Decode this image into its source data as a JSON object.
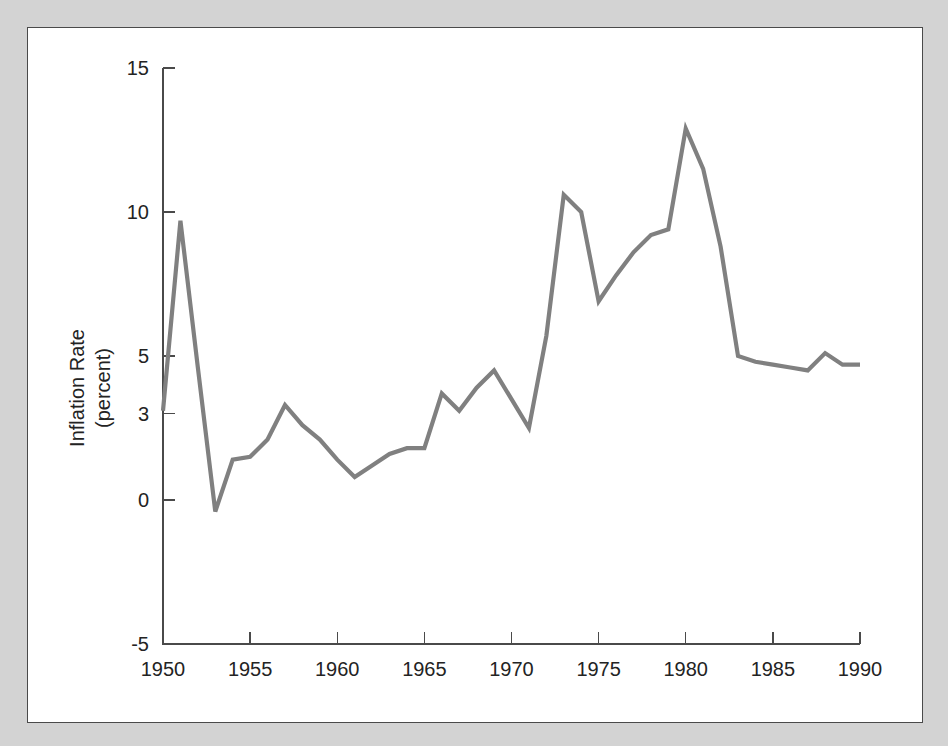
{
  "figure": {
    "background_color": "#d3d3d3",
    "panel_color": "#ffffff",
    "border_color": "#4a4a4a",
    "line_color": "#808080",
    "text_color": "#232323"
  },
  "axis": {
    "y_title_line1": "Inflation Rate",
    "y_title_line2": "(percent)",
    "x_title": ""
  },
  "chart_data": {
    "type": "line",
    "title": "",
    "xlabel": "",
    "ylabel": "Inflation Rate (percent)",
    "xlim": [
      1950,
      1990
    ],
    "ylim": [
      -5,
      15
    ],
    "grid": false,
    "legend": "none",
    "xticks": [
      1950,
      1955,
      1960,
      1965,
      1970,
      1975,
      1980,
      1985,
      1990
    ],
    "xtick_labels": [
      "1950",
      "1955",
      "1960",
      "1965",
      "1970",
      "1975",
      "1980",
      "1985",
      "1990"
    ],
    "yticks": [
      15,
      10,
      5,
      3,
      0,
      -5
    ],
    "ytick_labels": [
      "15",
      "10",
      "5",
      "3",
      "0",
      "-5"
    ],
    "series": [
      {
        "name": "Inflation Rate",
        "color": "#808080",
        "x": [
          1950,
          1951,
          1952,
          1953,
          1954,
          1955,
          1956,
          1957,
          1958,
          1959,
          1960,
          1961,
          1962,
          1963,
          1964,
          1965,
          1966,
          1967,
          1968,
          1969,
          1970,
          1971,
          1972,
          1973,
          1974,
          1975,
          1976,
          1977,
          1978,
          1979,
          1980,
          1981,
          1982,
          1983,
          1984,
          1985,
          1986,
          1987,
          1988,
          1989,
          1990
        ],
        "values": [
          3.1,
          9.7,
          4.6,
          -0.4,
          1.4,
          1.5,
          2.1,
          3.3,
          2.6,
          2.1,
          1.4,
          0.8,
          1.2,
          1.6,
          1.8,
          1.8,
          3.7,
          3.1,
          3.9,
          4.5,
          3.5,
          2.5,
          5.7,
          10.6,
          10.0,
          6.9,
          7.8,
          8.6,
          9.2,
          9.4,
          12.9,
          11.5,
          8.8,
          5.0,
          4.8,
          4.7,
          4.6,
          4.5,
          5.1,
          4.7,
          4.7
        ],
        "units": "percent"
      }
    ]
  }
}
